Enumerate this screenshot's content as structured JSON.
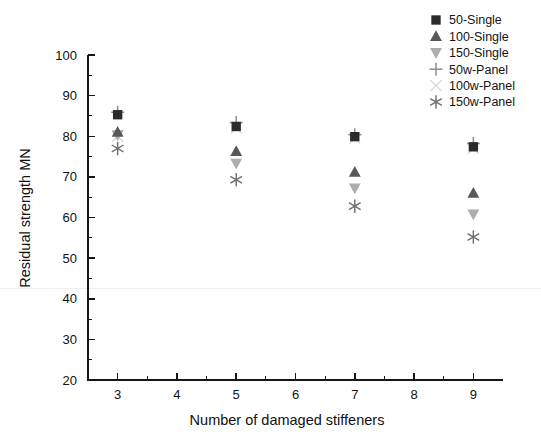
{
  "chart_data": {
    "type": "scatter",
    "title": "",
    "xlabel": "Number of damaged stiffeners",
    "ylabel": "Residual strength MN",
    "xlim": [
      2.5,
      9.5
    ],
    "ylim": [
      20,
      100
    ],
    "x_ticks": [
      3,
      4,
      5,
      6,
      7,
      8,
      9
    ],
    "x_tick_labels": [
      "3",
      "4",
      "5",
      "6",
      "7",
      "8",
      "9"
    ],
    "y_ticks": [
      20,
      30,
      40,
      50,
      60,
      70,
      80,
      90,
      100
    ],
    "y_tick_labels": [
      "20",
      "30",
      "40",
      "50",
      "60",
      "70",
      "80",
      "90",
      "100"
    ],
    "y_minor_ticks": [
      25,
      35,
      45,
      55,
      65,
      75,
      85,
      95
    ],
    "x_minor_ticks": [
      3.5,
      4.5,
      5.5,
      6.5,
      7.5,
      8.5
    ],
    "grid": false,
    "legend_position": "top-right",
    "x": [
      3,
      5,
      7,
      9
    ],
    "series": [
      {
        "name": "50-Single",
        "marker": "square",
        "color": "#2b2b2b",
        "values": [
          85.3,
          82.4,
          79.9,
          77.4
        ]
      },
      {
        "name": "100-Single",
        "marker": "triangle-up",
        "color": "#595959",
        "values": [
          81.0,
          76.3,
          71.2,
          66.0
        ]
      },
      {
        "name": "150-Single",
        "marker": "triangle-down",
        "color": "#adadad",
        "values": [
          80.3,
          73.3,
          67.2,
          60.8
        ]
      },
      {
        "name": "50w-Panel",
        "marker": "plus",
        "color": "#8c8c8c",
        "values": [
          85.9,
          83.4,
          80.4,
          78.2
        ]
      },
      {
        "name": "100w-Panel",
        "marker": "cross",
        "color": "#dcdcdc",
        "values": [
          80.0,
          82.0,
          79.5,
          77.0
        ]
      },
      {
        "name": "150w-Panel",
        "marker": "asterisk",
        "color": "#6e6e6e",
        "values": [
          77.0,
          69.3,
          62.8,
          55.2
        ]
      }
    ]
  },
  "axes": {
    "x_title": "Number of damaged stiffeners",
    "y_title": "Residual strength MN"
  },
  "legend": {
    "entries": [
      {
        "label": "50-Single",
        "marker": "square",
        "color": "#2b2b2b"
      },
      {
        "label": "100-Single",
        "marker": "triangle-up",
        "color": "#595959"
      },
      {
        "label": "150-Single",
        "marker": "triangle-down",
        "color": "#adadad"
      },
      {
        "label": "50w-Panel",
        "marker": "plus",
        "color": "#8c8c8c"
      },
      {
        "label": "100w-Panel",
        "marker": "cross",
        "color": "#dcdcdc"
      },
      {
        "label": "150w-Panel",
        "marker": "asterisk",
        "color": "#6e6e6e"
      }
    ]
  },
  "colors": {
    "background": "#ffffff",
    "axis": "#161616",
    "text": "#111111",
    "artifact_line": "#f0eef0"
  }
}
